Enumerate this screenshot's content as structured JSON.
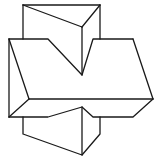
{
  "figure": {
    "stroke_color": "#1a1a1a",
    "background": "#ffffff",
    "edges": [
      {
        "name": "top-prism-left-edge",
        "points": [
          [
            23,
            5
          ],
          [
            23,
            39
          ]
        ]
      },
      {
        "name": "top-prism-top-edge",
        "points": [
          [
            23,
            5
          ],
          [
            100,
            5
          ]
        ]
      },
      {
        "name": "top-prism-diagonal",
        "points": [
          [
            23,
            5
          ],
          [
            82,
            27
          ]
        ]
      },
      {
        "name": "top-prism-front-diagonal",
        "points": [
          [
            82,
            27
          ],
          [
            100,
            5
          ]
        ]
      },
      {
        "name": "top-prism-right-edge",
        "points": [
          [
            100,
            5
          ],
          [
            100,
            39
          ]
        ]
      },
      {
        "name": "prism-center-edge-upper",
        "points": [
          [
            82,
            27
          ],
          [
            82,
            75
          ]
        ]
      },
      {
        "name": "slab-top-back",
        "points": [
          [
            9,
            39
          ],
          [
            48,
            39
          ],
          [
            82,
            75
          ],
          [
            93,
            39
          ],
          [
            133,
            39
          ]
        ]
      },
      {
        "name": "slab-right-slant",
        "points": [
          [
            133,
            39
          ],
          [
            153,
            99
          ]
        ]
      },
      {
        "name": "slab-left-slant",
        "points": [
          [
            9,
            39
          ],
          [
            29,
            99
          ]
        ]
      },
      {
        "name": "slab-front-top",
        "points": [
          [
            29,
            99
          ],
          [
            153,
            99
          ]
        ]
      },
      {
        "name": "slab-left-edge",
        "points": [
          [
            9,
            39
          ],
          [
            9,
            117
          ]
        ]
      },
      {
        "name": "slab-left-bottom-diag",
        "points": [
          [
            9,
            117
          ],
          [
            29,
            99
          ]
        ]
      },
      {
        "name": "slab-bottom",
        "points": [
          [
            9,
            117
          ],
          [
            48,
            117
          ],
          [
            82,
            107
          ],
          [
            93,
            117
          ],
          [
            133,
            117
          ],
          [
            153,
            99
          ]
        ]
      },
      {
        "name": "bottom-prism-left-edge",
        "points": [
          [
            23,
            117
          ],
          [
            23,
            134
          ],
          [
            82,
            155
          ],
          [
            100,
            134
          ],
          [
            100,
            117
          ]
        ]
      },
      {
        "name": "prism-center-edge-lower",
        "points": [
          [
            82,
            107
          ],
          [
            82,
            155
          ]
        ]
      }
    ]
  }
}
